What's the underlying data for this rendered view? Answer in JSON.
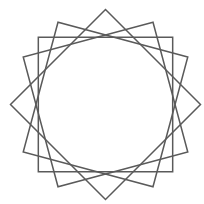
{
  "diagram": {
    "type": "rotated-squares-star",
    "background": "#ffffff",
    "stroke_color": "#5a5a5a",
    "stroke_width": 1.5,
    "center": [
      105.5,
      104.5
    ],
    "circumradius": 95,
    "squares": [
      {
        "name": "square-diamond",
        "vertex_angles_deg": [
          0,
          90,
          180,
          270
        ]
      },
      {
        "name": "square-rot-30",
        "vertex_angles_deg": [
          30,
          120,
          210,
          300
        ]
      },
      {
        "name": "square-axis-aligned",
        "vertex_angles_deg": [
          45,
          135,
          225,
          315
        ]
      },
      {
        "name": "square-rot-60",
        "vertex_angles_deg": [
          60,
          150,
          240,
          330
        ]
      }
    ]
  }
}
